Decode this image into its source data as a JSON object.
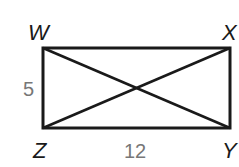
{
  "diagram": {
    "type": "rectangle-with-diagonals",
    "vertices": [
      {
        "name": "W",
        "x": 43,
        "y": 48,
        "label_x": 30,
        "label_y": 40
      },
      {
        "name": "X",
        "x": 230,
        "y": 48,
        "label_x": 223,
        "label_y": 40
      },
      {
        "name": "Y",
        "x": 230,
        "y": 128,
        "label_x": 223,
        "label_y": 158
      },
      {
        "name": "Z",
        "x": 43,
        "y": 128,
        "label_x": 33,
        "label_y": 158
      }
    ],
    "measurements": [
      {
        "side": "WZ",
        "value": "5",
        "x": 24,
        "y": 95
      },
      {
        "side": "ZY",
        "value": "12",
        "x": 126,
        "y": 158
      }
    ],
    "diagonals": [
      "WY",
      "XZ"
    ],
    "colors": {
      "line": "#1a1a1a",
      "vertex_label": "#1a1a1a",
      "measure_label": "#777777",
      "background": "#ffffff"
    }
  }
}
